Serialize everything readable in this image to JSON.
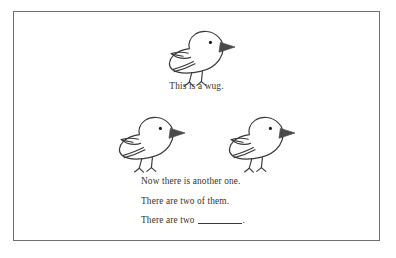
{
  "figure": {
    "border_color": "#6f6f72",
    "background_color": "#ffffff",
    "ink_color": "#333336",
    "beak_color": "#4a4a4d",
    "eye_color": "#1c1c1e"
  },
  "captions": {
    "wug_single": "This is a wug.",
    "line_another": "Now there is another one.",
    "line_two_of_them": "There are two of them.",
    "line_blank_prefix": "There are two",
    "line_blank_suffix": "."
  },
  "birds": [
    {
      "name": "bird-top",
      "label": "wug-single"
    },
    {
      "name": "bird-left",
      "label": "wug-pair-left"
    },
    {
      "name": "bird-right",
      "label": "wug-pair-right"
    }
  ]
}
